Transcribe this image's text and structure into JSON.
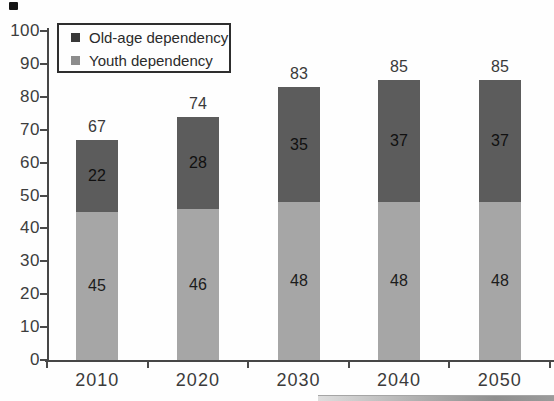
{
  "chart_data": {
    "type": "bar",
    "stacked": true,
    "title": "",
    "xlabel": "",
    "ylabel": "",
    "categories": [
      "2010",
      "2020",
      "2030",
      "2040",
      "2050"
    ],
    "series": [
      {
        "name": "Youth dependency",
        "values": [
          45,
          46,
          48,
          48,
          48
        ],
        "color": "#a6a6a6",
        "label_color": "#1c1c1c"
      },
      {
        "name": "Old-age dependency",
        "values": [
          22,
          28,
          35,
          37,
          37
        ],
        "color": "#5c5c5c",
        "label_color": "#101010"
      }
    ],
    "totals": [
      67,
      74,
      83,
      85,
      85
    ],
    "ylim": [
      0,
      100
    ],
    "yticks": [
      0,
      10,
      20,
      30,
      40,
      50,
      60,
      70,
      80,
      90,
      100
    ],
    "grid": false,
    "legend": {
      "position": "top-left",
      "items": [
        {
          "label": "Old-age dependency",
          "swatch": "#383838"
        },
        {
          "label": "Youth dependency",
          "swatch": "#8c8c8c"
        }
      ]
    },
    "axis_color": "#474747",
    "text_color": "#3d3d3d"
  }
}
